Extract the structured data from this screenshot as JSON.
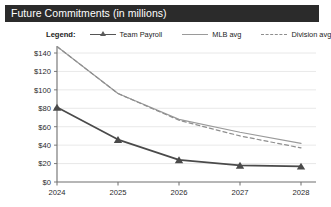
{
  "window": {
    "title": "Future Commitments (in millions)"
  },
  "legend": {
    "title": "Legend:",
    "items": [
      {
        "label": "Team Payroll",
        "style": "line-marker",
        "color": "#555555",
        "icon": "triangle-marker-icon"
      },
      {
        "label": "MLB avg",
        "style": "solid-line",
        "color": "#9a9a9a",
        "icon": "solid-line-icon"
      },
      {
        "label": "Division avg",
        "style": "dashed-line",
        "color": "#8e8e8e",
        "icon": "dashed-line-icon"
      }
    ]
  },
  "chart_data": {
    "type": "line",
    "title": "Future Commitments (in millions)",
    "xlabel": "",
    "ylabel": "",
    "x": [
      "2024",
      "2025",
      "2026",
      "2027",
      "2028"
    ],
    "categories": [
      "2024",
      "2025",
      "2026",
      "2027",
      "2028"
    ],
    "series": [
      {
        "name": "Team Payroll",
        "color": "#4a4a4a",
        "marker": "triangle",
        "dash": "solid",
        "values": [
          81,
          46,
          24,
          18,
          17
        ]
      },
      {
        "name": "MLB avg",
        "color": "#9a9a9a",
        "marker": "none",
        "dash": "solid",
        "values": [
          147,
          96,
          68,
          54,
          42
        ]
      },
      {
        "name": "Division avg",
        "color": "#8e8e8e",
        "marker": "none",
        "dash": "dashed",
        "values": [
          147,
          96,
          67,
          50,
          37
        ]
      }
    ],
    "ylim": [
      0,
      140
    ],
    "yticks": [
      "$0",
      "$20",
      "$40",
      "$60",
      "$80",
      "$100",
      "$120",
      "$140"
    ],
    "ytick_values": [
      0,
      20,
      40,
      60,
      80,
      100,
      120,
      140
    ],
    "xticks": [
      "2024",
      "2025",
      "2026",
      "2027",
      "2028"
    ],
    "grid": true,
    "legend_position": "top"
  },
  "axes": {
    "y_tick_labels": [
      "$140",
      "$120",
      "$100",
      "$80",
      "$60",
      "$40",
      "$20",
      "$0"
    ],
    "x_tick_labels": [
      "2024",
      "2025",
      "2026",
      "2027",
      "2028"
    ]
  },
  "colors": {
    "title_bar_bg": "#2b2b2b",
    "title_bar_text": "#ffffff",
    "grid": "#e2e2e2",
    "axis": "#6e6e6e",
    "page_bg": "#ffffff"
  }
}
